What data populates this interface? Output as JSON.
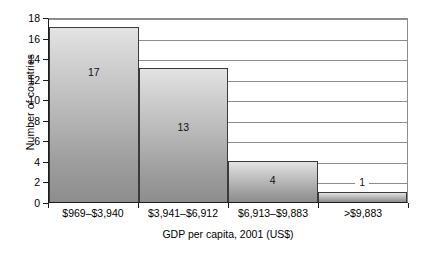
{
  "chart_data": {
    "type": "bar",
    "title": "",
    "xlabel": "GDP per capita, 2001 (US$)",
    "ylabel": "Number of countries",
    "categories": [
      "$969–$3,940",
      "$3,941–$6,912",
      "$6,913–$9,883",
      ">$9,883"
    ],
    "values": [
      17,
      13,
      4,
      1
    ],
    "value_labels": [
      "17",
      "13",
      "4",
      "1"
    ],
    "ylim": [
      0,
      18
    ],
    "yticks": [
      0,
      2,
      4,
      6,
      8,
      10,
      12,
      14,
      16,
      18
    ],
    "ytick_labels": [
      "0",
      "2",
      "4",
      "6",
      "8",
      "10",
      "12",
      "14",
      "16",
      "18"
    ],
    "grid": true,
    "grid_axis": "y",
    "legend": false,
    "bar_fill_top": "#e3e3e3",
    "bar_fill_bottom": "#8d8d8d",
    "bar_edge": "#3a3a3a",
    "grid_color": "#8d8d8d",
    "axis_color": "#1c1c1c",
    "background": "#ffffff"
  }
}
